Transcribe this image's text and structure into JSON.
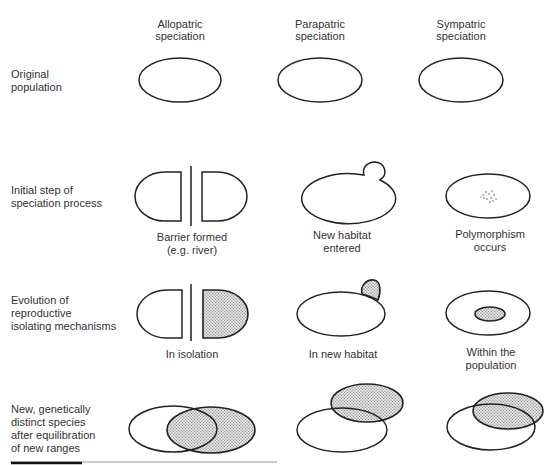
{
  "columns": [
    {
      "id": "allopatric",
      "label_lines": [
        "Allopatric",
        "speciation"
      ],
      "cx": 180
    },
    {
      "id": "parapatric",
      "label_lines": [
        "Parapatric",
        "speciation"
      ],
      "cx": 320
    },
    {
      "id": "sympatric",
      "label_lines": [
        "Sympatric",
        "speciation"
      ],
      "cx": 461
    }
  ],
  "rows": [
    {
      "id": "original",
      "label_lines": [
        "Original",
        "population"
      ]
    },
    {
      "id": "initial",
      "label_lines": [
        "Initial step of",
        "speciation process"
      ]
    },
    {
      "id": "evolution",
      "label_lines": [
        "Evolution of",
        "reproductive",
        "isolating mechanisms"
      ]
    },
    {
      "id": "new-species",
      "label_lines": [
        "New, genetically",
        "distinct species",
        "after equilibration",
        "of new ranges"
      ]
    }
  ],
  "captions": {
    "initial": {
      "allopatric": [
        "Barrier formed",
        "(e.g. river)"
      ],
      "parapatric": [
        "New habitat",
        "entered"
      ],
      "sympatric": [
        "Polymorphism",
        "occurs"
      ]
    },
    "evolution": {
      "allopatric": [
        "In isolation"
      ],
      "parapatric": [
        "In new habitat"
      ],
      "sympatric": [
        "Within the",
        "population"
      ]
    }
  },
  "colors": {
    "line": "#222222",
    "text": "#333333",
    "shade_dots": "#555555",
    "background": "#ffffff"
  }
}
